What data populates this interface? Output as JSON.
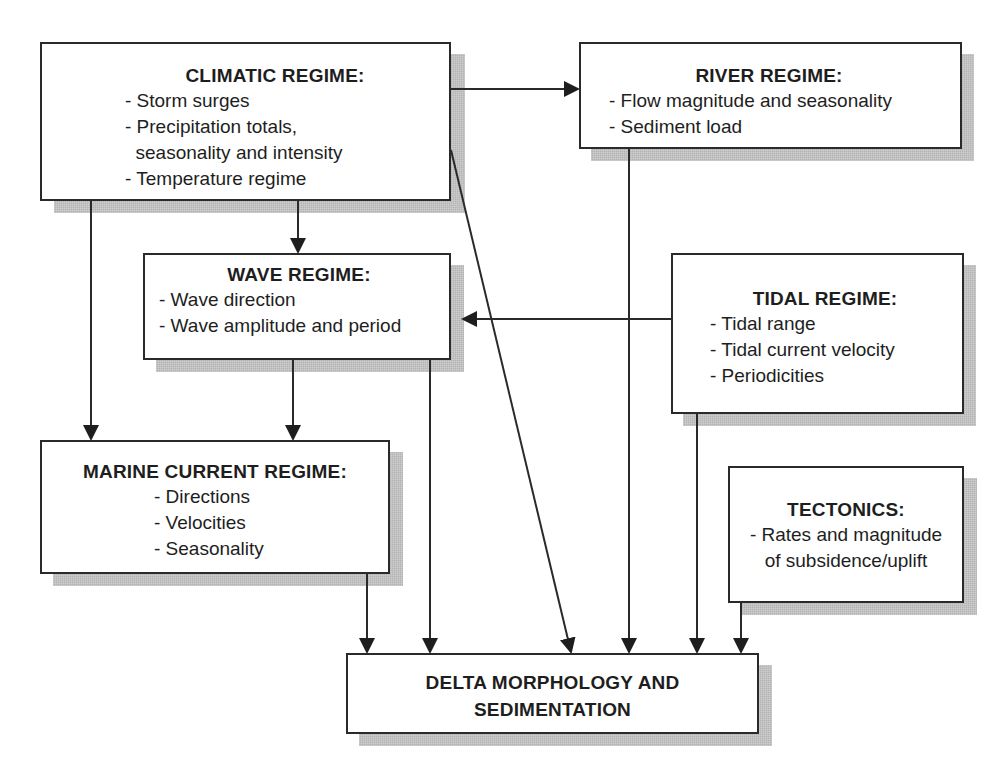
{
  "diagram": {
    "boxes": {
      "climatic": {
        "title": "CLIMATIC REGIME:",
        "items": [
          "- Storm surges",
          "- Precipitation totals,",
          "  seasonality and intensity",
          "- Temperature regime"
        ]
      },
      "river": {
        "title": "RIVER REGIME:",
        "items": [
          "- Flow magnitude and seasonality",
          "- Sediment load"
        ]
      },
      "wave": {
        "title": "WAVE REGIME:",
        "items": [
          "- Wave direction",
          "- Wave amplitude and period"
        ]
      },
      "tidal": {
        "title": "TIDAL REGIME:",
        "items": [
          "- Tidal range",
          "- Tidal current velocity",
          "- Periodicities"
        ]
      },
      "marine": {
        "title": "MARINE CURRENT REGIME:",
        "items": [
          "- Directions",
          "- Velocities",
          "- Seasonality"
        ]
      },
      "tectonics": {
        "title": "TECTONICS:",
        "items": [
          "- Rates and magnitude",
          "of subsidence/uplift"
        ]
      },
      "delta": {
        "title_lines": [
          "DELTA MORPHOLOGY AND",
          "SEDIMENTATION"
        ]
      }
    },
    "connections": [
      {
        "from": "climatic",
        "to": "river"
      },
      {
        "from": "climatic",
        "to": "wave"
      },
      {
        "from": "climatic",
        "to": "marine"
      },
      {
        "from": "climatic",
        "to": "delta"
      },
      {
        "from": "wave",
        "to": "marine"
      },
      {
        "from": "wave",
        "to": "delta"
      },
      {
        "from": "tidal",
        "to": "wave"
      },
      {
        "from": "tidal",
        "to": "delta"
      },
      {
        "from": "river",
        "to": "delta"
      },
      {
        "from": "marine",
        "to": "delta"
      },
      {
        "from": "tectonics",
        "to": "delta"
      }
    ],
    "colors": {
      "line": "#2a2a2a",
      "shadow": "#b4b4b4",
      "text": "#1e1e1e",
      "background": "#ffffff"
    }
  }
}
